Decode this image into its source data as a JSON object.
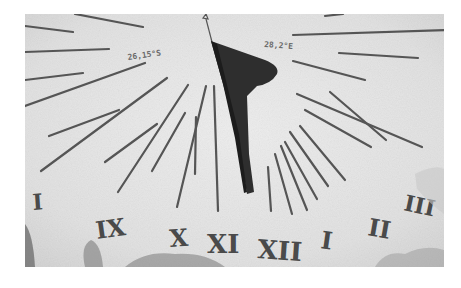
{
  "image": {
    "subject": "Sundial face photographed in black and white",
    "inscriptions": {
      "left": "26,15°S",
      "right": "28,2°E"
    },
    "hour_numerals": [
      {
        "label": "I",
        "x": 8,
        "y": 196,
        "size": 22,
        "rot": -4
      },
      {
        "label": "IX",
        "x": 72,
        "y": 225,
        "size": 24,
        "rot": -8
      },
      {
        "label": "X",
        "x": 145,
        "y": 233,
        "size": 24,
        "rot": -4
      },
      {
        "label": "XI",
        "x": 182,
        "y": 239,
        "size": 26,
        "rot": 0
      },
      {
        "label": "XII",
        "x": 232,
        "y": 244,
        "size": 26,
        "rot": 4
      },
      {
        "label": "I",
        "x": 295,
        "y": 234,
        "size": 24,
        "rot": 8
      },
      {
        "label": "II",
        "x": 342,
        "y": 221,
        "size": 24,
        "rot": 10
      },
      {
        "label": "III",
        "x": 378,
        "y": 196,
        "size": 22,
        "rot": 12
      }
    ],
    "colors": {
      "stone": "#e4e4e4",
      "line": "#555555",
      "gnomon": "#2e2e2e",
      "numeral": "#4a4a4a"
    }
  }
}
